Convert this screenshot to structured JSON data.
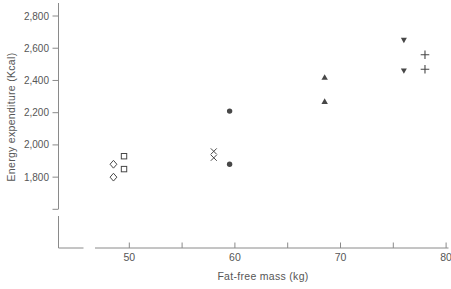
{
  "figure": {
    "background": "#ffffff",
    "ink_color": "#474747",
    "axis_color": "#8a8a8a",
    "label_color": "#565656"
  },
  "chart_data": {
    "type": "scatter",
    "title": "",
    "xlabel": "Fat-free mass (kg)",
    "ylabel": "Energy expenditure (Kcal)",
    "grid": false,
    "legend_position": "none",
    "x_axis": {
      "min": 50,
      "max": 80,
      "labeled_ticks": [
        50,
        60,
        70,
        80
      ],
      "tick_labels": [
        "50",
        "60",
        "70",
        "80"
      ],
      "minor_ticks": [
        55,
        65,
        75
      ],
      "broken_axis": true
    },
    "y_axis": {
      "min": 1800,
      "max": 2800,
      "ticks": [
        2800,
        2600,
        2400,
        2200,
        2000,
        1800
      ],
      "tick_labels": [
        "2,800",
        "2,600",
        "2,400",
        "2,200",
        "2,000",
        "1,800"
      ],
      "broken_axis": true
    },
    "series": [
      {
        "name": "open-diamond",
        "marker": "open-diamond",
        "points": [
          [
            48.5,
            1880
          ],
          [
            48.5,
            1800
          ]
        ]
      },
      {
        "name": "open-square",
        "marker": "open-square",
        "points": [
          [
            49.5,
            1930
          ],
          [
            49.5,
            1850
          ]
        ]
      },
      {
        "name": "x-cross",
        "marker": "x",
        "points": [
          [
            58,
            1960
          ],
          [
            58,
            1920
          ]
        ]
      },
      {
        "name": "filled-circle",
        "marker": "filled-circle",
        "points": [
          [
            59.5,
            2210
          ],
          [
            59.5,
            1880
          ]
        ]
      },
      {
        "name": "filled-triangle-up",
        "marker": "filled-triangle-up",
        "points": [
          [
            68.5,
            2420
          ],
          [
            68.5,
            2270
          ]
        ]
      },
      {
        "name": "filled-triangle-down",
        "marker": "filled-triangle-down",
        "points": [
          [
            76,
            2650
          ],
          [
            76,
            2460
          ]
        ]
      },
      {
        "name": "plus",
        "marker": "plus",
        "points": [
          [
            78,
            2560
          ],
          [
            78,
            2470
          ]
        ]
      }
    ]
  }
}
